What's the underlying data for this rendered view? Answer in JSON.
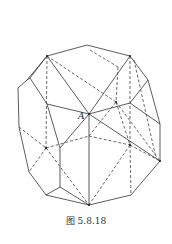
{
  "figure": {
    "caption": "图 5.8.18",
    "vertex_label": "A",
    "stroke_color": "#333333"
  },
  "diagram": {
    "type": "polyhedron-wireframe",
    "solid_edges": [
      [
        [
          87,
          45
        ],
        [
          130,
          56
        ]
      ],
      [
        [
          47,
          56
        ],
        [
          87,
          45
        ]
      ],
      [
        [
          47,
          56
        ],
        [
          30,
          78
        ]
      ],
      [
        [
          30,
          78
        ],
        [
          27,
          80
        ]
      ],
      [
        [
          27,
          80
        ],
        [
          18,
          88
        ]
      ],
      [
        [
          18,
          88
        ],
        [
          19,
          127
        ]
      ],
      [
        [
          19,
          127
        ],
        [
          29,
          172
        ]
      ],
      [
        [
          29,
          172
        ],
        [
          46,
          195
        ]
      ],
      [
        [
          46,
          195
        ],
        [
          89,
          205
        ]
      ],
      [
        [
          89,
          205
        ],
        [
          131,
          195
        ]
      ],
      [
        [
          131,
          195
        ],
        [
          160,
          161
        ]
      ],
      [
        [
          160,
          161
        ],
        [
          160,
          124
        ]
      ],
      [
        [
          160,
          124
        ],
        [
          148,
          80
        ]
      ],
      [
        [
          148,
          80
        ],
        [
          130,
          56
        ]
      ],
      [
        [
          47,
          56
        ],
        [
          89,
          114
        ]
      ],
      [
        [
          130,
          56
        ],
        [
          89,
          114
        ]
      ],
      [
        [
          89,
          114
        ],
        [
          160,
          161
        ]
      ],
      [
        [
          89,
          114
        ],
        [
          89,
          205
        ]
      ],
      [
        [
          30,
          78
        ],
        [
          47,
          104
        ]
      ],
      [
        [
          47,
          104
        ],
        [
          89,
          114
        ]
      ],
      [
        [
          47,
          104
        ],
        [
          60,
          148
        ]
      ],
      [
        [
          60,
          148
        ],
        [
          60,
          187
        ]
      ],
      [
        [
          60,
          187
        ],
        [
          46,
          195
        ]
      ],
      [
        [
          60,
          187
        ],
        [
          89,
          205
        ]
      ],
      [
        [
          60,
          148
        ],
        [
          89,
          114
        ]
      ],
      [
        [
          89,
          114
        ],
        [
          130,
          103
        ]
      ],
      [
        [
          130,
          103
        ],
        [
          148,
          80
        ]
      ],
      [
        [
          130,
          103
        ],
        [
          160,
          124
        ]
      ],
      [
        [
          27,
          80
        ],
        [
          47,
          56
        ]
      ]
    ],
    "dashed_edges": [
      [
        [
          47,
          56
        ],
        [
          46,
          148
        ]
      ],
      [
        [
          47,
          56
        ],
        [
          116,
          102
        ]
      ],
      [
        [
          90,
          50
        ],
        [
          118,
          67
        ]
      ],
      [
        [
          118,
          67
        ],
        [
          116,
          102
        ]
      ],
      [
        [
          130,
          56
        ],
        [
          130,
          145
        ]
      ],
      [
        [
          134,
          60
        ],
        [
          156,
          158
        ]
      ],
      [
        [
          116,
          102
        ],
        [
          160,
          161
        ]
      ],
      [
        [
          116,
          102
        ],
        [
          130,
          145
        ]
      ],
      [
        [
          19,
          127
        ],
        [
          46,
          148
        ]
      ],
      [
        [
          46,
          148
        ],
        [
          89,
          205
        ]
      ],
      [
        [
          46,
          148
        ],
        [
          29,
          172
        ]
      ],
      [
        [
          46,
          148
        ],
        [
          89,
          136
        ]
      ],
      [
        [
          89,
          136
        ],
        [
          130,
          145
        ]
      ],
      [
        [
          89,
          136
        ],
        [
          116,
          102
        ]
      ],
      [
        [
          130,
          145
        ],
        [
          89,
          205
        ]
      ],
      [
        [
          130,
          145
        ],
        [
          160,
          161
        ]
      ],
      [
        [
          130,
          145
        ],
        [
          131,
          195
        ]
      ]
    ],
    "points": [
      [
        89,
        114
      ],
      [
        47,
        56
      ],
      [
        130,
        56
      ],
      [
        160,
        161
      ],
      [
        89,
        205
      ],
      [
        46,
        148
      ],
      [
        130,
        145
      ],
      [
        116,
        102
      ]
    ]
  }
}
